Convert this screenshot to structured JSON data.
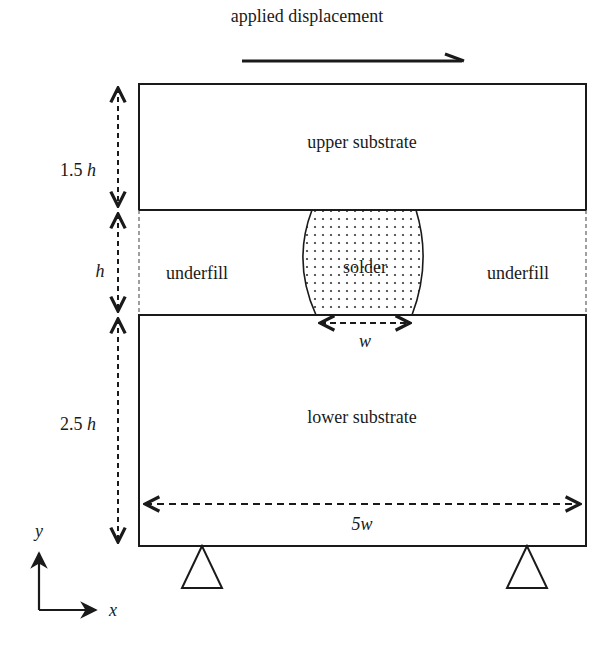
{
  "diagram": {
    "type": "schematic",
    "title_label": "applied displacement",
    "regions": {
      "upper": "upper substrate",
      "solder": "solder",
      "underfill_left": "underfill",
      "underfill_right": "underfill",
      "lower": "lower substrate"
    },
    "dimensions": {
      "upper_height": "1.5h",
      "middle_height": "h",
      "lower_height": "2.5h",
      "solder_width": "w",
      "total_width": "5w"
    },
    "axes": {
      "x": "x",
      "y": "y"
    },
    "colors": {
      "ink": "#1a1a1a",
      "background": "#ffffff",
      "dashed_boundary": "#888888"
    }
  }
}
